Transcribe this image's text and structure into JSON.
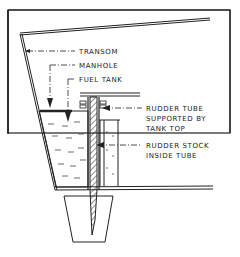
{
  "diagram": {
    "labels": {
      "transom": "TRANSOM",
      "manhole": "MANHOLE",
      "fuel_tank": "FUEL TANK",
      "rudder_tube_1": "RUDDER TUBE",
      "rudder_tube_2": "SUPPORTED BY",
      "rudder_tube_3": "TANK TOP",
      "rudder_stock_1": "RUDDER STOCK",
      "rudder_stock_2": "INSIDE TUBE"
    },
    "colors": {
      "ink": "#222222",
      "background": "#ffffff"
    }
  }
}
